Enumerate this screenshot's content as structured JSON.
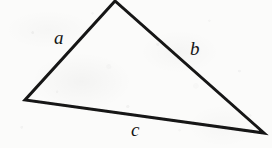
{
  "figure": {
    "kind": "geometry-diagram",
    "shape": "triangle",
    "background_color": "#fbfbfa",
    "stroke_color": "#141414",
    "label_color": "#141414",
    "width": 272,
    "height": 148,
    "medium": "scanned paper with gray speckle noise"
  },
  "triangle": {
    "vertices": [
      {
        "name": "apex",
        "x": 115,
        "y": 1
      },
      {
        "name": "left",
        "x": 25,
        "y": 100
      },
      {
        "name": "right",
        "x": 264,
        "y": 133
      }
    ],
    "points_attr": "115,1 25,100 264,133",
    "stroke_width": 3,
    "fill": "none"
  },
  "labels": {
    "a": {
      "text": "a",
      "side": "left-edge",
      "x": 54,
      "y": 28
    },
    "b": {
      "text": "b",
      "side": "right-edge",
      "x": 190,
      "y": 39
    },
    "c": {
      "text": "c",
      "side": "bottom-edge",
      "x": 131,
      "y": 120
    }
  }
}
